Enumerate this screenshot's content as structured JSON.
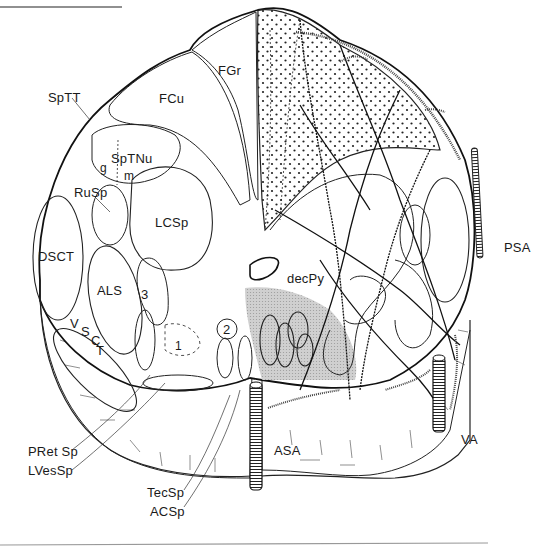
{
  "figure": {
    "colors": {
      "line": "#1a1a1a",
      "stipple_region": "#333333",
      "shaded_region": "#c8c8c8",
      "background": "#ffffff"
    }
  },
  "labels": {
    "FGr": "FGr",
    "FCu": "FCu",
    "SpTT": "SpTT",
    "SpTNu": "SpTNu",
    "g": "g",
    "m": "m",
    "RuSp": "RuSp",
    "LCSp": "LCSp",
    "DSCT": "DSCT",
    "ALS": "ALS",
    "n3": "3",
    "n2": "2",
    "n1": "1",
    "VSCT_V": "V",
    "VSCT_S": "S",
    "VSCT_C": "C",
    "VSCT_T": "T",
    "decPy": "decPy",
    "PSA": "PSA",
    "ASA": "ASA",
    "VA": "VA",
    "PRetSp": "PRet Sp",
    "LVesSp": "LVesSp",
    "TecSp": "TecSp",
    "ACSp": "ACSp"
  }
}
